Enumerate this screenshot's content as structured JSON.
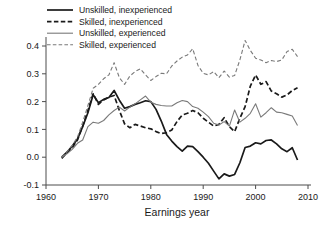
{
  "chart_data": {
    "type": "line",
    "title": "",
    "xlabel": "Earnings year",
    "ylabel": "",
    "xlim": [
      1960,
      2010
    ],
    "ylim": [
      -0.1,
      0.4
    ],
    "xticks": [
      "1960",
      "1970",
      "1980",
      "1990",
      "2000",
      "2010"
    ],
    "xtick_values": [
      1960,
      1970,
      1980,
      1990,
      2000,
      2010
    ],
    "yticks": [
      "-0.1",
      "0.0",
      "0.1",
      "0.2",
      "0.3",
      "0.4"
    ],
    "ytick_values": [
      -0.1,
      0.0,
      0.1,
      0.2,
      0.3,
      0.4
    ],
    "grid": false,
    "legend_position": "top-center",
    "x": [
      1963,
      1964,
      1965,
      1966,
      1967,
      1968,
      1969,
      1970,
      1971,
      1972,
      1973,
      1974,
      1975,
      1976,
      1977,
      1978,
      1979,
      1980,
      1981,
      1982,
      1983,
      1984,
      1985,
      1986,
      1987,
      1988,
      1989,
      1990,
      1991,
      1992,
      1993,
      1994,
      1995,
      1996,
      1997,
      1998,
      1999,
      2000,
      2001,
      2002,
      2003,
      2004,
      2005,
      2006,
      2007,
      2008
    ],
    "series": [
      {
        "name": "Unskilled, inexperienced",
        "style": "solid",
        "color": "#1a1a1a",
        "width": 1.7,
        "values": [
          0.0,
          0.018,
          0.04,
          0.065,
          0.11,
          0.16,
          0.225,
          0.196,
          0.208,
          0.215,
          0.24,
          0.205,
          0.176,
          0.182,
          0.19,
          0.196,
          0.203,
          0.2,
          0.172,
          0.13,
          0.082,
          0.058,
          0.038,
          0.022,
          0.04,
          0.038,
          0.02,
          0.0,
          -0.022,
          -0.05,
          -0.078,
          -0.06,
          -0.068,
          -0.062,
          -0.02,
          0.035,
          0.04,
          0.052,
          0.048,
          0.06,
          0.062,
          0.048,
          0.03,
          0.02,
          0.034,
          -0.01
        ]
      },
      {
        "name": "Skilled, inexperienced",
        "style": "dashed",
        "color": "#1a1a1a",
        "width": 1.7,
        "values": [
          -0.004,
          0.016,
          0.034,
          0.062,
          0.112,
          0.168,
          0.228,
          0.19,
          0.206,
          0.216,
          0.222,
          0.168,
          0.12,
          0.106,
          0.118,
          0.112,
          0.106,
          0.102,
          0.092,
          0.085,
          0.088,
          0.098,
          0.128,
          0.152,
          0.158,
          0.168,
          0.16,
          0.14,
          0.126,
          0.112,
          0.118,
          0.142,
          0.11,
          0.092,
          0.14,
          0.182,
          0.256,
          0.296,
          0.262,
          0.272,
          0.238,
          0.228,
          0.216,
          0.224,
          0.24,
          0.25
        ]
      },
      {
        "name": "Unskilled, experienced",
        "style": "solid",
        "color": "#7a7a7a",
        "width": 1.1,
        "values": [
          0.0,
          0.012,
          0.028,
          0.05,
          0.062,
          0.11,
          0.126,
          0.122,
          0.132,
          0.152,
          0.168,
          0.18,
          0.166,
          0.18,
          0.192,
          0.206,
          0.22,
          0.198,
          0.19,
          0.186,
          0.184,
          0.184,
          0.196,
          0.204,
          0.2,
          0.182,
          0.176,
          0.162,
          0.146,
          0.122,
          0.116,
          0.128,
          0.112,
          0.17,
          0.126,
          0.14,
          0.158,
          0.192,
          0.144,
          0.16,
          0.178,
          0.162,
          0.16,
          0.154,
          0.148,
          0.114
        ]
      },
      {
        "name": "Skilled, experienced",
        "style": "dashed",
        "color": "#7a7a7a",
        "width": 1.1,
        "values": [
          0.0,
          0.02,
          0.042,
          0.072,
          0.126,
          0.186,
          0.248,
          0.262,
          0.282,
          0.296,
          0.34,
          0.286,
          0.262,
          0.292,
          0.308,
          0.318,
          0.296,
          0.276,
          0.29,
          0.302,
          0.3,
          0.328,
          0.346,
          0.36,
          0.368,
          0.39,
          0.33,
          0.302,
          0.296,
          0.308,
          0.286,
          0.31,
          0.288,
          0.294,
          0.35,
          0.42,
          0.384,
          0.356,
          0.35,
          0.34,
          0.348,
          0.344,
          0.35,
          0.38,
          0.388,
          0.362
        ]
      }
    ]
  },
  "legend": {
    "items": [
      {
        "label": "Unskilled, inexperienced"
      },
      {
        "label": "Skilled, inexperienced"
      },
      {
        "label": "Unskilled, experienced"
      },
      {
        "label": "Skilled, experienced"
      }
    ]
  },
  "colors": {
    "dark": "#1a1a1a",
    "light": "#7a7a7a",
    "axis": "#4d4d4d",
    "background": "#ffffff"
  }
}
